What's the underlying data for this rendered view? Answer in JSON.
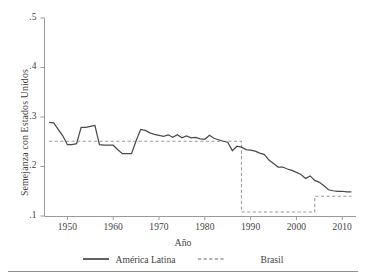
{
  "chart_data": {
    "type": "line",
    "title": "",
    "xlabel": "Año",
    "ylabel": "Semejanza con Estados Unidos",
    "xlim": [
      1945,
      2013
    ],
    "ylim": [
      0.1,
      0.5
    ],
    "xticks": [
      1950,
      1960,
      1970,
      1980,
      1990,
      2000,
      2010
    ],
    "xtick_labels": [
      "1950",
      "1960",
      "1970",
      "1980",
      "1990",
      "2000",
      "2010"
    ],
    "yticks": [
      0.1,
      0.2,
      0.3,
      0.4,
      0.5
    ],
    "ytick_labels": [
      ".1",
      ".2",
      ".3",
      ".4",
      ".5"
    ],
    "grid": false,
    "legend_position": "below",
    "series": [
      {
        "name": "América Latina",
        "style": "solid",
        "color": "#4a4a4a",
        "x": [
          1946,
          1947,
          1948,
          1949,
          1950,
          1951,
          1952,
          1953,
          1954,
          1955,
          1956,
          1957,
          1958,
          1959,
          1960,
          1961,
          1962,
          1963,
          1964,
          1965,
          1966,
          1967,
          1968,
          1969,
          1970,
          1971,
          1972,
          1973,
          1974,
          1975,
          1976,
          1977,
          1978,
          1979,
          1980,
          1981,
          1982,
          1983,
          1984,
          1985,
          1986,
          1987,
          1988,
          1989,
          1990,
          1991,
          1992,
          1993,
          1994,
          1995,
          1996,
          1997,
          1998,
          1999,
          2000,
          2001,
          2002,
          2003,
          2004,
          2005,
          2006,
          2007,
          2008,
          2009,
          2010,
          2011,
          2012
        ],
        "values": [
          0.289,
          0.288,
          0.275,
          0.262,
          0.244,
          0.244,
          0.246,
          0.279,
          0.279,
          0.281,
          0.283,
          0.244,
          0.243,
          0.243,
          0.243,
          0.234,
          0.226,
          0.226,
          0.226,
          0.252,
          0.275,
          0.273,
          0.268,
          0.265,
          0.263,
          0.261,
          0.264,
          0.259,
          0.264,
          0.258,
          0.262,
          0.258,
          0.259,
          0.256,
          0.255,
          0.263,
          0.257,
          0.254,
          0.251,
          0.249,
          0.232,
          0.241,
          0.239,
          0.234,
          0.233,
          0.231,
          0.227,
          0.224,
          0.213,
          0.206,
          0.199,
          0.199,
          0.195,
          0.192,
          0.188,
          0.184,
          0.176,
          0.181,
          0.172,
          0.168,
          0.161,
          0.153,
          0.151,
          0.15,
          0.15,
          0.149,
          0.149
        ]
      },
      {
        "name": "Brasil",
        "style": "dashed",
        "color": "#9a9a9a",
        "x": [
          1946,
          1986,
          1987,
          1988,
          2002,
          2003,
          2004,
          2012
        ],
        "values": [
          0.251,
          0.251,
          0.251,
          0.108,
          0.108,
          0.108,
          0.14,
          0.14
        ]
      }
    ]
  },
  "legend": {
    "america_latina": "América Latina",
    "brasil": "Brasil"
  },
  "axis": {
    "ylabel": "Semejanza con Estados Unidos",
    "xlabel": "Año"
  },
  "colors": {
    "america_latina": "#4a4a4a",
    "brasil": "#9a9a9a",
    "axis": "#9a9a9a",
    "text": "#3f3f3f",
    "rule": "#8f8f8f"
  }
}
